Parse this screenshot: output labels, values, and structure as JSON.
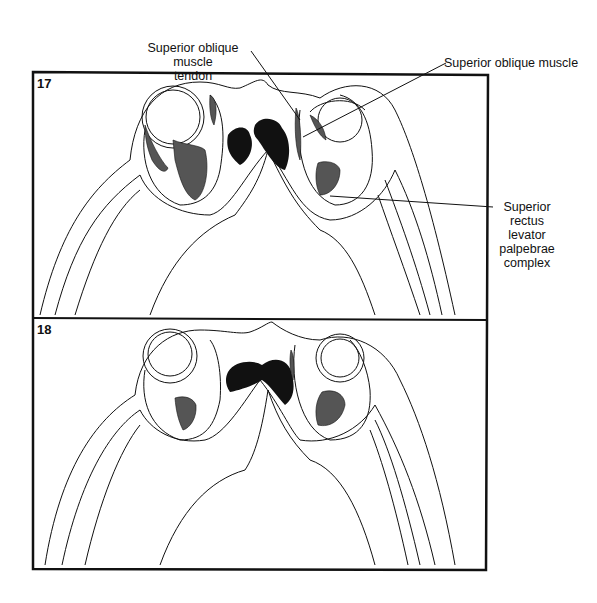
{
  "figure": {
    "panels": [
      {
        "number": "17"
      },
      {
        "number": "18"
      }
    ],
    "labels": {
      "so_tendon_line1": "Superior oblique muscle",
      "so_tendon_line2": "tendon",
      "so_muscle": "Superior oblique muscle",
      "sr_line1": "Superior",
      "sr_line2": "rectus",
      "sr_line3": "levator",
      "sr_line4": "palpebrae",
      "sr_line5": "complex"
    }
  }
}
